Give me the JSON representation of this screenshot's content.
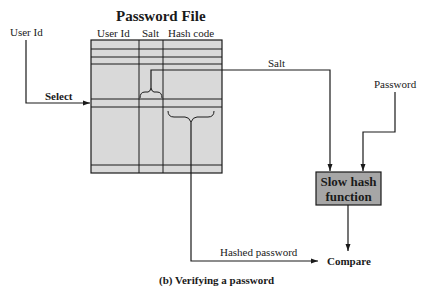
{
  "diagram": {
    "title": "Password File",
    "columns": [
      "User Id",
      "Salt",
      "Hash code"
    ],
    "inputs": {
      "user_id": "User Id",
      "password": "Password"
    },
    "labels": {
      "select": "Select",
      "salt": "Salt",
      "hashed_password": "Hashed password",
      "compare": "Compare"
    },
    "hash_box": {
      "line1": "Slow hash",
      "line2": "function",
      "fill": "#a6a6a6"
    },
    "table_fill": "#d9d9d9",
    "caption": "(b) Verifying a password"
  }
}
